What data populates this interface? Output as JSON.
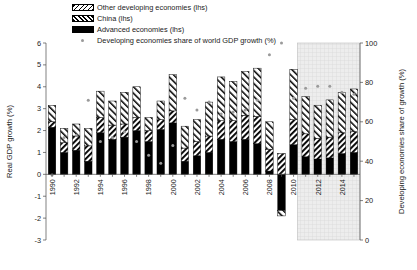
{
  "legend": {
    "items": [
      {
        "label": "Other developing economies (lhs)",
        "swatch": "hatch-backslash",
        "name": "legend-other-developing"
      },
      {
        "label": "China (lhs)",
        "swatch": "hatch-slash",
        "name": "legend-china"
      },
      {
        "label": "Advanced economies (lhs)",
        "swatch": "solid-black",
        "name": "legend-advanced"
      },
      {
        "label": "Developing economies share of world GDP growth (%)",
        "swatch": "grey-dot",
        "name": "legend-share-marker"
      }
    ]
  },
  "chart_data": {
    "type": "bar",
    "title": "",
    "xlabel": "",
    "ylabel": "Real GDP growth (%)",
    "y2label": "Developing economies share of growth (%)",
    "ylim": [
      -3,
      6
    ],
    "y2lim": [
      0,
      100
    ],
    "yticks": [
      -3,
      -2,
      -1,
      0,
      1,
      2,
      3,
      4,
      5,
      6
    ],
    "y2ticks": [
      0,
      20,
      40,
      60,
      80,
      100
    ],
    "grid": false,
    "legend_position": "top-left",
    "stacked": true,
    "forecast_start": "2011",
    "forecast_shading": "#e9e9e9",
    "categories": [
      "1990",
      "1991",
      "1992",
      "1993",
      "1994",
      "1995",
      "1996",
      "1997",
      "1998",
      "1999",
      "2000",
      "2001",
      "2002",
      "2003",
      "2004",
      "2005",
      "2006",
      "2007",
      "2008",
      "2009",
      "2010",
      "2011",
      "2012",
      "2013",
      "2014",
      "2015"
    ],
    "xtick_labels": [
      "1990",
      "",
      "1992",
      "",
      "1994",
      "",
      "1996",
      "",
      "1998",
      "",
      "2000",
      "",
      "2002",
      "",
      "2004",
      "",
      "2006",
      "",
      "2008",
      "",
      "2010",
      "",
      "2012",
      "",
      "2014",
      ""
    ],
    "series": [
      {
        "name": "Advanced economies (lhs)",
        "color": "#000000",
        "pattern": "solid",
        "values": [
          2.15,
          1.0,
          1.1,
          0.6,
          1.9,
          1.6,
          1.7,
          2.0,
          1.5,
          2.05,
          2.35,
          0.6,
          0.85,
          1.0,
          1.6,
          1.5,
          1.6,
          1.4,
          0.15,
          -1.65,
          1.35,
          0.8,
          0.7,
          0.75,
          0.95,
          1.0
        ]
      },
      {
        "name": "China (lhs)",
        "color": "#000000",
        "pattern": "hatch-slash",
        "values": [
          0.25,
          0.45,
          0.65,
          0.7,
          0.7,
          0.65,
          0.6,
          0.6,
          0.5,
          0.45,
          0.55,
          0.6,
          0.65,
          0.75,
          0.85,
          0.95,
          1.1,
          1.25,
          1.0,
          0.95,
          1.15,
          1.05,
          0.95,
          0.95,
          0.95,
          0.95
        ]
      },
      {
        "name": "Other developing economies (lhs)",
        "color": "#000000",
        "pattern": "hatch-backslash",
        "values": [
          0.75,
          0.65,
          0.55,
          0.8,
          1.2,
          1.1,
          1.45,
          1.4,
          0.6,
          0.85,
          1.65,
          1.0,
          1.0,
          1.55,
          2.0,
          1.8,
          2.0,
          2.2,
          1.25,
          -0.25,
          2.3,
          1.7,
          1.5,
          1.7,
          1.85,
          1.95
        ]
      }
    ],
    "marker_series": {
      "name": "Developing economies share of world GDP growth (%)",
      "color": "#9a9a9a",
      "axis": "right",
      "values": [
        33,
        52,
        53,
        71,
        50,
        52,
        55,
        50,
        43,
        39,
        48,
        72,
        66,
        70,
        64,
        65,
        66,
        71,
        94,
        100,
        72,
        77,
        78,
        78,
        75,
        74
      ]
    }
  }
}
